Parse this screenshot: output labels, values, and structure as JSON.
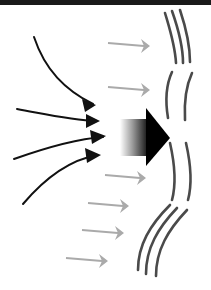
{
  "diagram": {
    "width": 211,
    "height": 290,
    "top_bar": {
      "color": "#1a1a1a",
      "height": 5
    },
    "colors": {
      "black_arrow": "#111111",
      "gray_arrow": "#aaaaaa",
      "wave_line": "#4a4a4a",
      "big_arrow_head": "#000000"
    },
    "converging_arrows": [
      {
        "path": "M34,37 C45,70 65,90 93,104",
        "head": "85,112 96,105 82,99"
      },
      {
        "path": "M17,109 C45,114 70,120 97,121",
        "head": "86,128 100,121 86,114"
      },
      {
        "path": "M14,159 C45,148 75,139 103,137",
        "head": "92,144 106,136 90,130"
      },
      {
        "path": "M23,204 C45,178 70,160 97,155",
        "head": "87,163 101,155 85,148"
      }
    ],
    "big_arrow": {
      "body": {
        "x": 120,
        "y": 119,
        "w": 28,
        "h": 37
      },
      "head": "146,108 170,138 146,166"
    },
    "gray_arrows": [
      {
        "x1": 108,
        "y1": 43,
        "x2": 150,
        "y2": 46
      },
      {
        "x1": 108,
        "y1": 87,
        "x2": 150,
        "y2": 90
      },
      {
        "x1": 105,
        "y1": 175,
        "x2": 146,
        "y2": 178
      },
      {
        "x1": 88,
        "y1": 203,
        "x2": 129,
        "y2": 206
      },
      {
        "x1": 82,
        "y1": 230,
        "x2": 124,
        "y2": 233
      },
      {
        "x1": 66,
        "y1": 258,
        "x2": 108,
        "y2": 261
      }
    ],
    "waves": [
      {
        "d": "M165,13 C170,30 175,45 176,63"
      },
      {
        "d": "M172,11 C178,28 183,45 183,63"
      },
      {
        "d": "M180,10 C186,28 190,45 190,62"
      },
      {
        "d": "M172,72 C166,85 165,100 168,118"
      },
      {
        "d": "M192,73 C186,86 184,102 185,120"
      },
      {
        "d": "M170,143 C175,165 176,185 172,200"
      },
      {
        "d": "M186,143 C191,165 192,185 188,200"
      },
      {
        "d": "M170,205 C150,225 138,245 138,270"
      },
      {
        "d": "M177,208 C158,228 146,248 146,274"
      },
      {
        "d": "M187,210 C168,230 156,250 156,276"
      }
    ]
  }
}
